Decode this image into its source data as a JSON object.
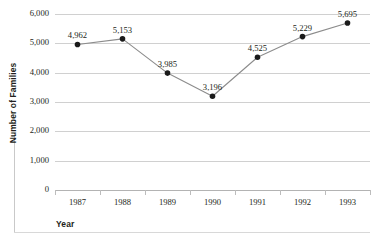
{
  "chart_data": {
    "type": "line",
    "title": "",
    "xlabel": "Year",
    "ylabel": "Number of Families",
    "categories": [
      "1987",
      "1988",
      "1989",
      "1990",
      "1991",
      "1992",
      "1993"
    ],
    "values": [
      4962,
      5153,
      3985,
      3196,
      4525,
      5229,
      5695
    ],
    "point_labels": [
      "4,962",
      "5,153",
      "3,985",
      "3,196",
      "4,525",
      "5,229",
      "5,695"
    ],
    "ylim": [
      0,
      6000
    ],
    "yticks": [
      0,
      1000,
      2000,
      3000,
      4000,
      5000,
      6000
    ],
    "ytick_labels": [
      "0",
      "1,000",
      "2,000",
      "3,000",
      "4,000",
      "5,000",
      "6,000"
    ],
    "grid": true,
    "legend": false,
    "series_name": "Number of Families",
    "marker": "circle",
    "colors": {
      "line": "#8c8c8c",
      "marker": "#1a1a1a",
      "gridline": "#d0d0d0",
      "baseline": "#b3b3b3",
      "text": "#231f20",
      "rule": "#c9c9c9"
    }
  }
}
